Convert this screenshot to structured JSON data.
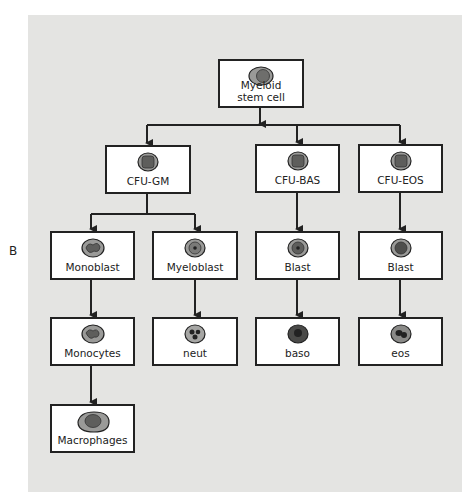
{
  "figure_label": "B",
  "diagram": {
    "nodes": [
      {
        "id": "myeloid",
        "label_line1": "Myeloid",
        "label_line2": "stem cell",
        "cell": "stem-cell-icon"
      },
      {
        "id": "cfu_gm",
        "label": "CFU-GM",
        "cell": "progenitor-cell-icon"
      },
      {
        "id": "cfu_bas",
        "label": "CFU-BAS",
        "cell": "progenitor-cell-icon"
      },
      {
        "id": "cfu_eos",
        "label": "CFU-EOS",
        "cell": "progenitor-cell-icon"
      },
      {
        "id": "monoblast",
        "label": "Monoblast",
        "cell": "monoblast-cell-icon"
      },
      {
        "id": "myeloblast",
        "label": "Myeloblast",
        "cell": "myeloblast-cell-icon"
      },
      {
        "id": "blast_bas",
        "label": "Blast",
        "cell": "blast-cell-icon"
      },
      {
        "id": "blast_eos",
        "label": "Blast",
        "cell": "blast-cell-icon"
      },
      {
        "id": "monocytes",
        "label": "Monocytes",
        "cell": "monocyte-cell-icon"
      },
      {
        "id": "neut",
        "label": "neut",
        "cell": "neutrophil-cell-icon"
      },
      {
        "id": "baso",
        "label": "baso",
        "cell": "basophil-cell-icon"
      },
      {
        "id": "eos",
        "label": "eos",
        "cell": "eosinophil-cell-icon"
      },
      {
        "id": "macrophages",
        "label": "Macrophages",
        "cell": "macrophage-cell-icon"
      }
    ],
    "edges": [
      [
        "myeloid",
        "cfu_gm"
      ],
      [
        "myeloid",
        "cfu_bas"
      ],
      [
        "myeloid",
        "cfu_eos"
      ],
      [
        "cfu_gm",
        "monoblast"
      ],
      [
        "cfu_gm",
        "myeloblast"
      ],
      [
        "cfu_bas",
        "blast_bas"
      ],
      [
        "cfu_eos",
        "blast_eos"
      ],
      [
        "monoblast",
        "monocytes"
      ],
      [
        "myeloblast",
        "neut"
      ],
      [
        "blast_bas",
        "baso"
      ],
      [
        "blast_eos",
        "eos"
      ],
      [
        "monocytes",
        "macrophages"
      ]
    ]
  },
  "colors": {
    "panel": "#e4e4e2",
    "box_border": "#222222",
    "cell_fill": "#9a9a98"
  }
}
